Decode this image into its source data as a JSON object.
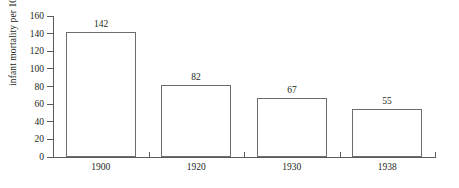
{
  "chart_data": {
    "type": "bar",
    "title": "",
    "subtitle": "",
    "xlabel": "",
    "ylabel": "infant mortality per 1000",
    "categories": [
      "1900",
      "1920",
      "1930",
      "1938"
    ],
    "values": [
      142,
      82,
      67,
      55
    ],
    "value_labels": [
      "142",
      "82",
      "67",
      "55"
    ],
    "ylim": [
      0,
      160
    ],
    "yticks": [
      0,
      20,
      40,
      60,
      80,
      100,
      120,
      140,
      160
    ],
    "ytick_labels": [
      "0",
      "20",
      "40",
      "60",
      "80",
      "100",
      "120",
      "140",
      "160"
    ],
    "grid": false,
    "legend": null,
    "legend_position": "none",
    "bar_fill_color": "#ffffff",
    "bar_border_color": "#6d6d6d",
    "axis_color": "#5b5b5b",
    "text_color": "#231f20",
    "background_color": "#ffffff"
  }
}
